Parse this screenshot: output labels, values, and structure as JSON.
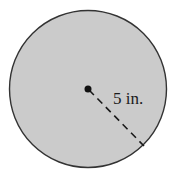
{
  "diagram": {
    "shape": "circle",
    "fill_color": "#cbcbcb",
    "stroke_color": "#333333",
    "center_point": true,
    "radius_line_style": "dashed",
    "radius_label": "5 in.",
    "radius_value": 5,
    "radius_unit": "in."
  }
}
